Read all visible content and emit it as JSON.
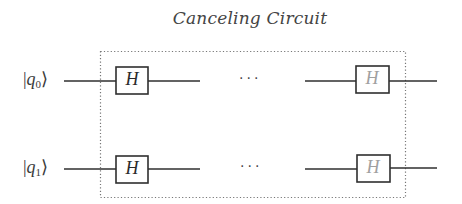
{
  "title": "Canceling Circuit",
  "qubits": [
    {
      "label_prefix": "|",
      "label_var": "q",
      "label_sub": "0",
      "label_suffix": "⟩"
    },
    {
      "label_prefix": "|",
      "label_var": "q",
      "label_sub": "1",
      "label_suffix": "⟩"
    }
  ],
  "gates": {
    "q0_first": "H",
    "q0_last": "H",
    "q1_first": "H",
    "q1_last": "H"
  },
  "ellipsis": "···",
  "colors": {
    "wire": "#2f2f2f",
    "gate_border": "#2f2f2f",
    "gate_text_first": "#2a2a2a",
    "gate_text_last": "#a0a0a0",
    "dotted_box": "#777777"
  }
}
